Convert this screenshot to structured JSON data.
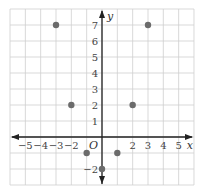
{
  "chart_data": {
    "type": "scatter",
    "title": "",
    "xlabel": "x",
    "ylabel": "y",
    "origin_label": "O",
    "xlim": [
      -6,
      6
    ],
    "ylim": [
      -3,
      8
    ],
    "grid": true,
    "x_ticks": [
      -5,
      -4,
      -3,
      -2,
      2,
      3,
      4,
      5
    ],
    "x_tick_labels": [
      "−5",
      "−4",
      "−3",
      "−2",
      "2",
      "3",
      "4",
      "5"
    ],
    "y_ticks": [
      7,
      6,
      5,
      4,
      3,
      2,
      1,
      -2
    ],
    "y_tick_labels": [
      "7",
      "6",
      "5",
      "4",
      "3",
      "2",
      "1",
      "−2"
    ],
    "points": [
      {
        "x": -3,
        "y": 7
      },
      {
        "x": 3,
        "y": 7
      },
      {
        "x": -2,
        "y": 2
      },
      {
        "x": 2,
        "y": 2
      },
      {
        "x": -1,
        "y": -1
      },
      {
        "x": 1,
        "y": -1
      },
      {
        "x": 0,
        "y": -2
      }
    ],
    "colors": {
      "point": "#6b6b6b",
      "axis": "#222222",
      "grid": "#cfcfcf"
    }
  }
}
